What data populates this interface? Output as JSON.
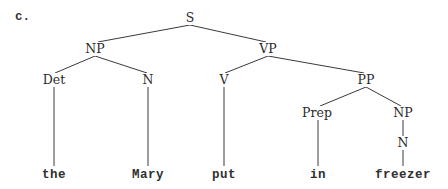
{
  "example_label": "c.",
  "nodes": {
    "S": {
      "label": "S",
      "x": 190,
      "y": 18
    },
    "NP1": {
      "label": "NP",
      "x": 95,
      "y": 49
    },
    "VP": {
      "label": "VP",
      "x": 268,
      "y": 49
    },
    "Det": {
      "label": "Det",
      "x": 54,
      "y": 80
    },
    "N1": {
      "label": "N",
      "x": 148,
      "y": 80
    },
    "V": {
      "label": "V",
      "x": 224,
      "y": 80
    },
    "PP": {
      "label": "PP",
      "x": 366,
      "y": 80
    },
    "Prep": {
      "label": "Prep",
      "x": 317,
      "y": 113
    },
    "NP2": {
      "label": "NP",
      "x": 403,
      "y": 113
    },
    "N2": {
      "label": "N",
      "x": 403,
      "y": 143
    },
    "the": {
      "label": "the",
      "x": 54,
      "y": 175
    },
    "Mary": {
      "label": "Mary",
      "x": 148,
      "y": 175
    },
    "put": {
      "label": "put",
      "x": 224,
      "y": 175
    },
    "in": {
      "label": "in",
      "x": 318,
      "y": 175
    },
    "freezer": {
      "label": "freezer",
      "x": 403,
      "y": 175
    }
  },
  "edges": [
    {
      "from": "S",
      "to": "NP1",
      "x1": 190,
      "y1": 25,
      "x2": 98,
      "y2": 42
    },
    {
      "from": "S",
      "to": "VP",
      "x1": 190,
      "y1": 25,
      "x2": 266,
      "y2": 42
    },
    {
      "from": "NP1",
      "to": "Det",
      "x1": 95,
      "y1": 56,
      "x2": 55,
      "y2": 73
    },
    {
      "from": "NP1",
      "to": "N1",
      "x1": 95,
      "y1": 56,
      "x2": 147,
      "y2": 73
    },
    {
      "from": "VP",
      "to": "V",
      "x1": 268,
      "y1": 56,
      "x2": 225,
      "y2": 73
    },
    {
      "from": "VP",
      "to": "PP",
      "x1": 268,
      "y1": 56,
      "x2": 364,
      "y2": 73
    },
    {
      "from": "PP",
      "to": "Prep",
      "x1": 366,
      "y1": 87,
      "x2": 320,
      "y2": 106
    },
    {
      "from": "PP",
      "to": "NP2",
      "x1": 366,
      "y1": 87,
      "x2": 401,
      "y2": 106
    },
    {
      "from": "NP2",
      "to": "N2",
      "x1": 403,
      "y1": 120,
      "x2": 403,
      "y2": 136
    },
    {
      "from": "Det",
      "to": "the",
      "x1": 54,
      "y1": 87,
      "x2": 54,
      "y2": 166
    },
    {
      "from": "N1",
      "to": "Mary",
      "x1": 148,
      "y1": 87,
      "x2": 148,
      "y2": 166
    },
    {
      "from": "V",
      "to": "put",
      "x1": 224,
      "y1": 87,
      "x2": 224,
      "y2": 166
    },
    {
      "from": "Prep",
      "to": "in",
      "x1": 318,
      "y1": 120,
      "x2": 318,
      "y2": 166
    },
    {
      "from": "N2",
      "to": "freezer",
      "x1": 403,
      "y1": 150,
      "x2": 403,
      "y2": 166
    }
  ],
  "sentence": [
    "the",
    "Mary",
    "put",
    "in",
    "freezer"
  ]
}
